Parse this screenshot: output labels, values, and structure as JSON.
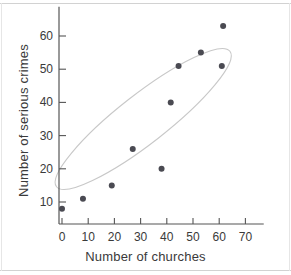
{
  "chart_data": {
    "type": "scatter",
    "title": "",
    "xlabel": "Number of churches",
    "ylabel": "Number of serious crimes",
    "xlim": [
      -5,
      77
    ],
    "ylim": [
      2,
      67
    ],
    "xticks": [
      0,
      10,
      20,
      30,
      40,
      50,
      60,
      70
    ],
    "yticks": [
      10,
      20,
      30,
      40,
      50,
      60
    ],
    "xtick_labels": [
      "0",
      "10",
      "20",
      "30",
      "40",
      "50",
      "60",
      "70"
    ],
    "ytick_labels": [
      "10",
      "20",
      "30",
      "40",
      "50",
      "60"
    ],
    "grid": false,
    "legend": null,
    "points": [
      {
        "x": 0,
        "y": 8
      },
      {
        "x": 8,
        "y": 11
      },
      {
        "x": 19,
        "y": 15
      },
      {
        "x": 27,
        "y": 26
      },
      {
        "x": 38,
        "y": 20
      },
      {
        "x": 41.5,
        "y": 40
      },
      {
        "x": 44.5,
        "y": 51
      },
      {
        "x": 53,
        "y": 55
      },
      {
        "x": 61,
        "y": 51
      },
      {
        "x": 61.5,
        "y": 63
      }
    ],
    "annotations": [
      {
        "type": "ellipse",
        "name": "correlation-envelope",
        "center_x": 31,
        "center_y": 35,
        "radius_x": 42,
        "radius_y": 15,
        "rotation_deg": -38,
        "color": "#c8c8c8"
      }
    ],
    "marker_color": "#4a4a52",
    "axis_color": "#555555"
  }
}
